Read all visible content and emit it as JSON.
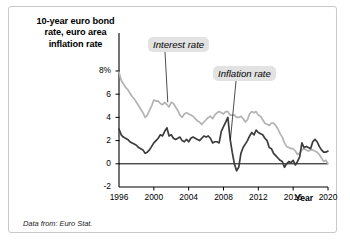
{
  "figure": {
    "title": "10-year euro bond rate, euro area inflation rate",
    "title_lines": [
      "10-year euro bond",
      "rate, euro area",
      "inflation rate"
    ],
    "source_note": "Data from: Euro Stat."
  },
  "colors": {
    "interest_rate_line": "#b3b3b3",
    "inflation_rate_line": "#3c3c3c",
    "axis": "#000000",
    "frame_border": "#c9c9c9",
    "callout_background": "#e2e2e2",
    "page_background": "#ffffff"
  },
  "chart_data": {
    "type": "line",
    "title": "10-year euro bond rate, euro area inflation rate",
    "xlabel": "Year",
    "ylabel": "",
    "xlim": [
      1996,
      2020
    ],
    "ylim": [
      -2,
      8
    ],
    "grid": false,
    "legend_position": "inline-callout",
    "xticks": [
      1996,
      2000,
      2004,
      2008,
      2012,
      2016,
      2020
    ],
    "xtick_labels": [
      "1996",
      "2000",
      "2004",
      "2008",
      "2012",
      "2016",
      "2020"
    ],
    "yticks": [
      -2,
      0,
      2,
      4,
      6,
      8
    ],
    "ytick_labels": [
      "-2",
      "0",
      "2",
      "4",
      "6",
      "8%"
    ],
    "annotations": [
      {
        "text": "Interest rate",
        "points_to_series": "Interest rate",
        "at_x": 2001.6,
        "at_y": 5.3
      },
      {
        "text": "Inflation rate",
        "points_to_series": "Inflation rate",
        "at_x": 2008.8,
        "at_y": 2.1
      }
    ],
    "series": [
      {
        "name": "Interest rate",
        "color": "#b3b3b3",
        "x": [
          1996.0,
          1996.25,
          1996.5,
          1996.75,
          1997.0,
          1997.25,
          1997.5,
          1997.75,
          1998.0,
          1998.25,
          1998.5,
          1998.75,
          1999.0,
          1999.25,
          1999.5,
          1999.75,
          2000.0,
          2000.25,
          2000.5,
          2000.75,
          2001.0,
          2001.25,
          2001.5,
          2001.75,
          2002.0,
          2002.25,
          2002.5,
          2002.75,
          2003.0,
          2003.25,
          2003.5,
          2003.75,
          2004.0,
          2004.25,
          2004.5,
          2004.75,
          2005.0,
          2005.25,
          2005.5,
          2005.75,
          2006.0,
          2006.25,
          2006.5,
          2006.75,
          2007.0,
          2007.25,
          2007.5,
          2007.75,
          2008.0,
          2008.25,
          2008.5,
          2008.75,
          2009.0,
          2009.25,
          2009.5,
          2009.75,
          2010.0,
          2010.25,
          2010.5,
          2010.75,
          2011.0,
          2011.25,
          2011.5,
          2011.75,
          2012.0,
          2012.25,
          2012.5,
          2012.75,
          2013.0,
          2013.25,
          2013.5,
          2013.75,
          2014.0,
          2014.25,
          2014.5,
          2014.75,
          2015.0,
          2015.25,
          2015.5,
          2015.75,
          2016.0,
          2016.25,
          2016.5,
          2016.75,
          2017.0,
          2017.25,
          2017.5,
          2017.75,
          2018.0,
          2018.25,
          2018.5,
          2018.75,
          2019.0,
          2019.25,
          2019.5,
          2019.75,
          2020.0
        ],
        "y": [
          7.9,
          7.2,
          6.9,
          6.6,
          6.4,
          6.1,
          5.8,
          5.6,
          5.3,
          5.0,
          4.7,
          4.4,
          4.0,
          4.2,
          4.6,
          5.0,
          5.5,
          5.4,
          5.4,
          5.2,
          5.1,
          5.3,
          5.1,
          4.9,
          5.3,
          5.2,
          4.9,
          4.6,
          4.2,
          4.0,
          4.3,
          4.4,
          4.3,
          4.2,
          4.1,
          3.9,
          3.7,
          3.6,
          3.4,
          3.6,
          3.8,
          4.0,
          4.1,
          3.9,
          4.2,
          4.4,
          4.5,
          4.4,
          4.3,
          4.5,
          4.5,
          4.2,
          4.2,
          4.2,
          4.0,
          4.0,
          4.1,
          3.9,
          3.6,
          3.8,
          4.3,
          4.5,
          4.4,
          4.5,
          4.2,
          4.1,
          3.8,
          3.5,
          3.4,
          3.3,
          3.5,
          3.5,
          3.3,
          3.0,
          2.6,
          2.3,
          1.8,
          1.5,
          1.4,
          1.3,
          1.3,
          1.1,
          0.8,
          0.9,
          1.2,
          1.3,
          1.2,
          1.1,
          1.2,
          1.2,
          1.1,
          1.0,
          0.8,
          0.5,
          0.2,
          0.3,
          0.0
        ]
      },
      {
        "name": "Inflation rate",
        "color": "#3c3c3c",
        "x": [
          1996.0,
          1996.25,
          1996.5,
          1996.75,
          1997.0,
          1997.25,
          1997.5,
          1997.75,
          1998.0,
          1998.25,
          1998.5,
          1998.75,
          1999.0,
          1999.25,
          1999.5,
          1999.75,
          2000.0,
          2000.25,
          2000.5,
          2000.75,
          2001.0,
          2001.25,
          2001.5,
          2001.75,
          2002.0,
          2002.25,
          2002.5,
          2002.75,
          2003.0,
          2003.25,
          2003.5,
          2003.75,
          2004.0,
          2004.25,
          2004.5,
          2004.75,
          2005.0,
          2005.25,
          2005.5,
          2005.75,
          2006.0,
          2006.25,
          2006.5,
          2006.75,
          2007.0,
          2007.25,
          2007.5,
          2007.75,
          2008.0,
          2008.25,
          2008.5,
          2008.75,
          2009.0,
          2009.25,
          2009.5,
          2009.75,
          2010.0,
          2010.25,
          2010.5,
          2010.75,
          2011.0,
          2011.25,
          2011.5,
          2011.75,
          2012.0,
          2012.25,
          2012.5,
          2012.75,
          2013.0,
          2013.25,
          2013.5,
          2013.75,
          2014.0,
          2014.25,
          2014.5,
          2014.75,
          2015.0,
          2015.25,
          2015.5,
          2015.75,
          2016.0,
          2016.25,
          2016.5,
          2016.75,
          2017.0,
          2017.25,
          2017.5,
          2017.75,
          2018.0,
          2018.25,
          2018.5,
          2018.75,
          2019.0,
          2019.25,
          2019.5,
          2019.75,
          2020.0
        ],
        "y": [
          3.0,
          2.5,
          2.3,
          2.2,
          2.1,
          1.9,
          1.8,
          1.7,
          1.6,
          1.4,
          1.3,
          1.2,
          0.9,
          1.0,
          1.2,
          1.5,
          1.8,
          2.0,
          2.2,
          2.5,
          2.4,
          2.8,
          3.1,
          2.4,
          2.5,
          2.2,
          2.1,
          2.2,
          2.3,
          2.0,
          1.9,
          2.1,
          1.9,
          2.2,
          2.3,
          2.2,
          2.1,
          2.0,
          2.2,
          2.4,
          2.3,
          2.4,
          2.2,
          1.8,
          1.9,
          1.9,
          1.8,
          2.8,
          3.2,
          3.6,
          4.0,
          2.2,
          1.0,
          0.0,
          -0.6,
          -0.3,
          0.9,
          1.4,
          1.7,
          2.0,
          2.4,
          2.7,
          2.5,
          2.9,
          2.7,
          2.6,
          2.5,
          2.2,
          2.0,
          1.4,
          1.3,
          0.9,
          0.7,
          0.5,
          0.3,
          0.2,
          -0.3,
          0.0,
          0.2,
          0.1,
          0.3,
          -0.1,
          0.2,
          0.6,
          1.8,
          1.4,
          1.5,
          1.4,
          1.3,
          1.9,
          2.1,
          1.9,
          1.5,
          1.2,
          1.0,
          1.0,
          1.1
        ]
      }
    ]
  },
  "axis_title": {
    "x": "Year"
  }
}
